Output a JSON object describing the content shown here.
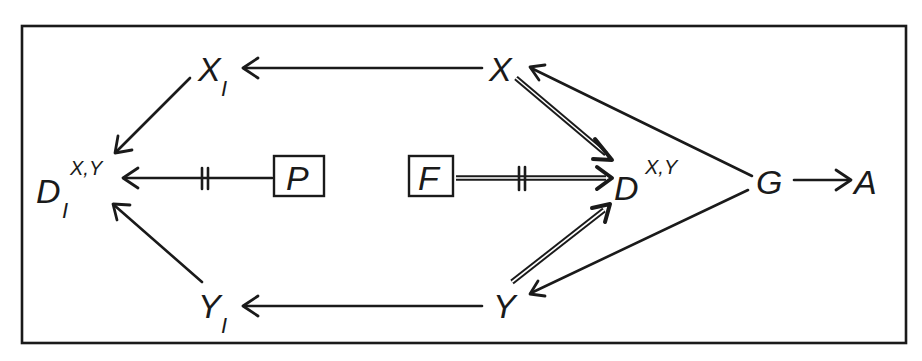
{
  "diagram": {
    "type": "causal-graph",
    "nodes": {
      "X_I": {
        "label": "X",
        "sub": "I"
      },
      "X": {
        "label": "X"
      },
      "D_I": {
        "label": "D",
        "sup": "X,Y",
        "sub": "I"
      },
      "P": {
        "label": "P",
        "boxed": true
      },
      "F": {
        "label": "F",
        "boxed": true
      },
      "D": {
        "label": "D",
        "sup": "X,Y"
      },
      "G": {
        "label": "G"
      },
      "A": {
        "label": "A"
      },
      "Y_I": {
        "label": "Y",
        "sub": "I"
      },
      "Y": {
        "label": "Y"
      }
    },
    "edges": [
      {
        "from": "X",
        "to": "X_I",
        "style": "single"
      },
      {
        "from": "X_I",
        "to": "D_I",
        "style": "single"
      },
      {
        "from": "P",
        "to": "D_I",
        "style": "single",
        "blocked": true
      },
      {
        "from": "Y_I",
        "to": "D_I",
        "style": "single"
      },
      {
        "from": "Y",
        "to": "Y_I",
        "style": "single"
      },
      {
        "from": "X",
        "to": "D",
        "style": "double"
      },
      {
        "from": "F",
        "to": "D",
        "style": "double",
        "blocked": true
      },
      {
        "from": "Y",
        "to": "D",
        "style": "double"
      },
      {
        "from": "G",
        "to": "X",
        "style": "single"
      },
      {
        "from": "G",
        "to": "Y",
        "style": "single"
      },
      {
        "from": "G",
        "to": "A",
        "style": "single"
      }
    ],
    "colors": {
      "ink": "#1a1a1a",
      "background": "#ffffff"
    }
  }
}
